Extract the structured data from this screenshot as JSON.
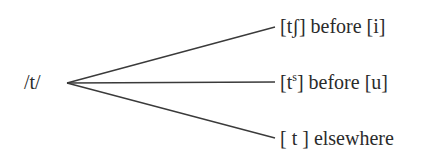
{
  "diagram": {
    "type": "allophone-tree",
    "root": "/t/",
    "branches": [
      {
        "allophone": "[tʃ]",
        "environment": "before [i]"
      },
      {
        "allophone_base": "[t",
        "allophone_sup": "s",
        "allophone_close": "]",
        "environment": "before [u]"
      },
      {
        "allophone": "[ t ]",
        "environment": "elsewhere"
      }
    ],
    "line_color": "#3a3a3a",
    "text_color": "#2b2b2b"
  }
}
